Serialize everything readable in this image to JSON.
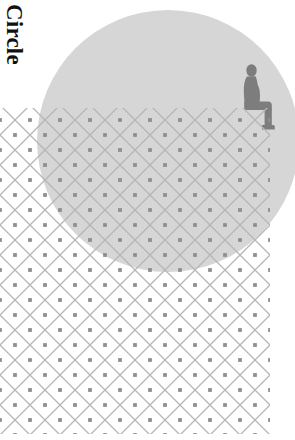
{
  "artwork": {
    "caption": "Circle",
    "caption_orientation": "vertical-rotated-90-clockwise",
    "background_color": "#ffffff",
    "text_color": "#111111"
  },
  "shapes": {
    "circle": {
      "name": "Circle",
      "fill": "#d6d6d6",
      "center_x": 168,
      "center_y": 141,
      "radius": 131
    },
    "figure": {
      "name": "Seated person silhouette",
      "fill": "#7d7d7d",
      "pose": "seated",
      "x": 240,
      "y": 66,
      "width": 38,
      "height": 64
    },
    "fence": {
      "name": "Chain-link diamond mesh",
      "line_color": "#b5b5b5",
      "node_color": "#8f8f8f",
      "cell_size": 30,
      "left": 0,
      "top": 108,
      "right": 270,
      "bottom": 434
    }
  },
  "canvas": {
    "width": 295,
    "height": 440
  }
}
